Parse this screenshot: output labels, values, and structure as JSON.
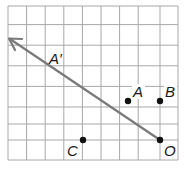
{
  "figure": {
    "type": "coordinate-grid-diagram",
    "grid": {
      "columns": 8,
      "rows": 7,
      "line_color": "#a0a0a0",
      "background": "#ffffff"
    },
    "line": {
      "color": "#7a7a7a",
      "from_point": "O",
      "through_point": "A",
      "arrow_direction": "upper-left",
      "arrowhead": true
    },
    "points": [
      {
        "name": "A",
        "label": "A",
        "grid_x": 6,
        "grid_y": 2,
        "dot": true
      },
      {
        "name": "B",
        "label": "B",
        "grid_x": 8,
        "grid_y": 2,
        "dot": true
      },
      {
        "name": "C",
        "label": "C",
        "grid_x": 4,
        "grid_y": 4,
        "dot": true
      },
      {
        "name": "O",
        "label": "O",
        "grid_x": 8,
        "grid_y": 4,
        "dot": true
      },
      {
        "name": "A-prime",
        "label": "A′",
        "grid_x": 2,
        "grid_y": 0,
        "dot": false,
        "on_line": true
      }
    ],
    "labels": {
      "A": "A",
      "B": "B",
      "C": "C",
      "O": "O",
      "A_prime": "A′"
    }
  }
}
